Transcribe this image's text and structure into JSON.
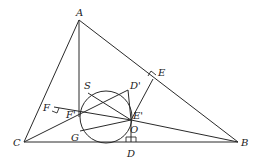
{
  "diagram": {
    "type": "geometry",
    "points": {
      "A": {
        "label": "A",
        "x": 79,
        "y": 20
      },
      "B": {
        "label": "B",
        "x": 238,
        "y": 142
      },
      "C": {
        "label": "C",
        "x": 24,
        "y": 142
      },
      "D": {
        "label": "D",
        "x": 131,
        "y": 142
      },
      "E": {
        "label": "E",
        "x": 153,
        "y": 79
      },
      "F": {
        "label": "F",
        "x": 54,
        "y": 107
      },
      "O": {
        "label": "O",
        "x": 131,
        "y": 120
      },
      "S": {
        "label": "S",
        "x": 79,
        "y": 90
      },
      "D_prime": {
        "label": "D'",
        "x": 126,
        "y": 89
      },
      "E_prime": {
        "label": "E'",
        "x": 131,
        "y": 120
      },
      "F_prime": {
        "label": "F'",
        "x": 80,
        "y": 117
      },
      "G": {
        "label": "G",
        "x": 80,
        "y": 131
      }
    },
    "circle": {
      "cx": 106,
      "cy": 117,
      "r": 26
    },
    "labels": [
      "A",
      "B",
      "C",
      "D",
      "E",
      "F",
      "O",
      "S",
      "D'",
      "E'",
      "F'",
      "G"
    ]
  }
}
